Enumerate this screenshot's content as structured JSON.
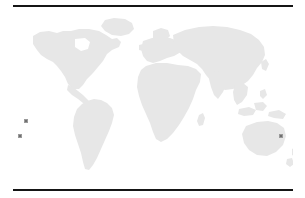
{
  "figure": {
    "kind": "world-map",
    "background_color": "#ffffff",
    "rules": {
      "color": "#151515",
      "top_label": "top-rule",
      "bottom_label": "bottom-rule"
    },
    "land": {
      "fill_color": "#e7e7e7",
      "regions": [
        "North America",
        "South America",
        "Greenland",
        "Europe",
        "Africa",
        "Asia",
        "Australia",
        "New Zealand",
        "Indonesia",
        "Japan",
        "British Isles",
        "Madagascar"
      ]
    },
    "markers": {
      "fill_color": "#6f6f6f",
      "edge_color": "#9a9a9a",
      "points": [
        {
          "id": "marker-1",
          "x": 26,
          "y": 121
        },
        {
          "id": "marker-2",
          "x": 20,
          "y": 136
        },
        {
          "id": "marker-3",
          "x": 281,
          "y": 136
        }
      ]
    }
  }
}
